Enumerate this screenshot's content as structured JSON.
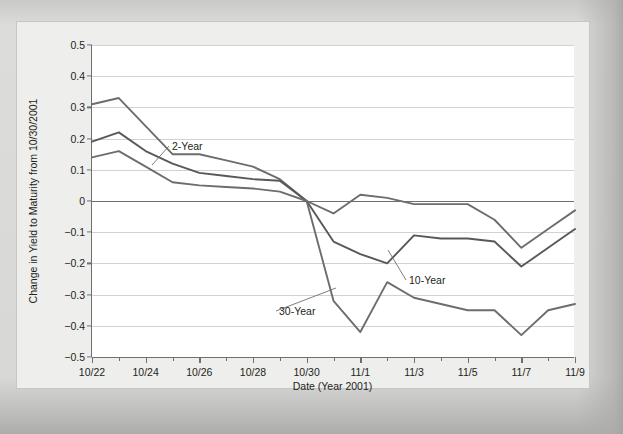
{
  "chart_data": {
    "type": "line",
    "title": "",
    "xlabel": "Date (Year 2001)",
    "ylabel": "Change in Yield to Maturity from 10/30/2001",
    "x": [
      "10/22",
      "10/23",
      "10/24",
      "10/25",
      "10/26",
      "10/27",
      "10/28",
      "10/29",
      "10/30",
      "10/31",
      "11/1",
      "11/2",
      "11/3",
      "11/4",
      "11/5",
      "11/6",
      "11/7",
      "11/8",
      "11/9"
    ],
    "xtick_labels": [
      "10/22",
      "10/24",
      "10/26",
      "10/28",
      "10/30",
      "11/1",
      "11/3",
      "11/5",
      "11/7",
      "11/9"
    ],
    "ytick_labels": [
      "0.5",
      "0.4",
      "0.3",
      "0.2",
      "0.1",
      "0",
      "-0.1",
      "-0.2",
      "-0.3",
      "-0.4",
      "-0.5"
    ],
    "ytick_values": [
      0.5,
      0.4,
      0.3,
      0.2,
      0.1,
      0,
      -0.1,
      -0.2,
      -0.3,
      -0.4,
      -0.5
    ],
    "ylim": [
      -0.5,
      0.5
    ],
    "grid": true,
    "legend_position": "inline-annotations",
    "series": [
      {
        "name": "2-Year",
        "color": "#6d6d6d",
        "values": [
          0.31,
          0.33,
          0.24,
          0.15,
          0.15,
          0.13,
          0.11,
          0.07,
          0.0,
          -0.04,
          0.02,
          0.01,
          -0.01,
          -0.01,
          -0.01,
          -0.06,
          -0.15,
          -0.09,
          -0.03
        ]
      },
      {
        "name": "10-Year",
        "color": "#585858",
        "values": [
          0.19,
          0.22,
          0.16,
          0.12,
          0.09,
          0.08,
          0.07,
          0.065,
          0.0,
          -0.13,
          -0.17,
          -0.2,
          -0.11,
          -0.12,
          -0.12,
          -0.13,
          -0.21,
          -0.15,
          -0.09
        ]
      },
      {
        "name": "30-Year",
        "color": "#6d6d6d",
        "values": [
          0.14,
          0.16,
          0.11,
          0.06,
          0.05,
          0.045,
          0.04,
          0.03,
          0.0,
          -0.32,
          -0.42,
          -0.26,
          -0.31,
          -0.33,
          -0.35,
          -0.35,
          -0.43,
          -0.35,
          -0.33
        ]
      }
    ],
    "annotations": [
      {
        "text": "2-Year",
        "label_x": 155,
        "label_y": 118,
        "leader_to_x": 134,
        "leader_to_y": 143
      },
      {
        "text": "10-Year",
        "label_x": 392,
        "label_y": 252,
        "leader_to_x": 370,
        "leader_to_y": 228
      },
      {
        "text": "30-Year",
        "label_x": 262,
        "label_y": 283,
        "leader_to_x": 318,
        "leader_to_y": 266
      }
    ]
  }
}
